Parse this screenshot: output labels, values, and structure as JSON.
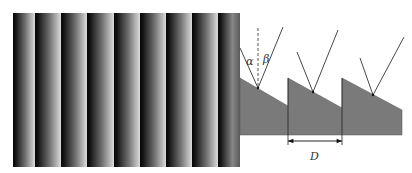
{
  "figure": {
    "grating_photo": {
      "description": "Striped intensity pattern of blazed grating",
      "x0": 13,
      "y0": 13,
      "x1": 240,
      "y1": 167,
      "stripe_boundaries": [
        13,
        35,
        61,
        87,
        114,
        140,
        166,
        192,
        218,
        240
      ],
      "colors": {
        "dark": "#050505",
        "mid": "#6a6a6a",
        "light": "#d4d4d4"
      }
    },
    "cross_section": {
      "fill": "#7a7a7a",
      "base_bottom_y": 135,
      "teeth": [
        {
          "x_start": 240,
          "top_y": 78,
          "x_end": 288,
          "end_y": 106
        },
        {
          "x_start": 288,
          "top_y": 78,
          "x_end": 342,
          "end_y": 108
        },
        {
          "x_start": 342,
          "top_y": 78,
          "x_end": 402,
          "end_y": 110
        }
      ],
      "rays": [
        {
          "apex": [
            258,
            88
          ],
          "left": [
            240,
            48
          ],
          "right": [
            283,
            27
          ],
          "normal": true
        },
        {
          "apex": [
            313,
            92
          ],
          "left": [
            297,
            52
          ],
          "right": [
            338,
            30
          ],
          "normal": false
        },
        {
          "apex": [
            373,
            95
          ],
          "left": [
            360,
            58
          ],
          "right": [
            404,
            37
          ],
          "normal": false
        }
      ],
      "normal_line": {
        "x": 258,
        "y_top": 28,
        "y_bottom": 88
      }
    },
    "labels": {
      "alpha": "α",
      "beta": "β",
      "period": "D"
    },
    "period_arrow": {
      "x_start": 288,
      "x_end": 342,
      "y": 141
    }
  }
}
